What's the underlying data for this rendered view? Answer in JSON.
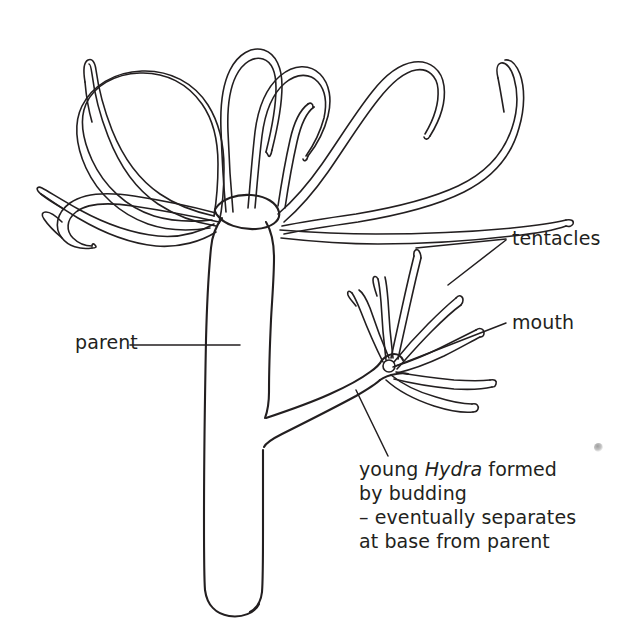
{
  "figure": {
    "background_color": "#ffffff",
    "ink_color": "#231f20"
  },
  "labels": {
    "tentacles": "tentacles",
    "mouth": "mouth",
    "parent": "parent",
    "young_line1_a": "young ",
    "young_line1_sci": "Hydra",
    "young_line1_b": " formed",
    "young_line2": "by budding",
    "young_line3": "– eventually separates",
    "young_line4": "at base from parent"
  },
  "parts": {
    "parent_body": "parent-hydra-body",
    "parent_hypostome": "parent-hypostome",
    "parent_tentacles_count": 9,
    "bud_body": "young-hydra-bud-body",
    "bud_mouth": "young-hydra-mouth",
    "bud_tentacles_count": 7,
    "basal_disc": "parent-basal-disc"
  }
}
